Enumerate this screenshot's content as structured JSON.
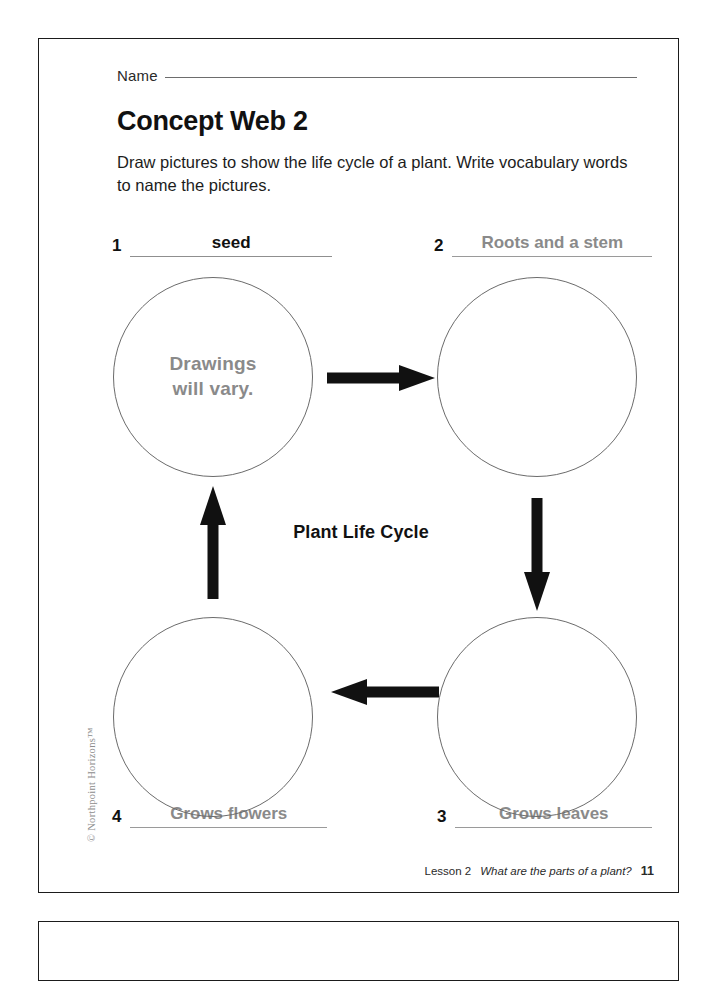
{
  "page": {
    "name_label": "Name",
    "title": "Concept Web 2",
    "instructions": "Draw pictures to show the life cycle of a plant. Write vocabulary words to name the pictures.",
    "center_label": "Plant Life Cycle",
    "circle_note": "Drawings\nwill vary.",
    "circle_note_line1": "Drawings",
    "circle_note_line2": "will vary.",
    "copyright": "© Northpoint Horizons™"
  },
  "slots": [
    {
      "number": "1",
      "answer": "seed",
      "style": "dark"
    },
    {
      "number": "2",
      "answer": "Roots and a stem",
      "style": "gray"
    },
    {
      "number": "3",
      "answer": "Grows leaves",
      "style": "gray"
    },
    {
      "number": "4",
      "answer": "Grows flowers",
      "style": "gray"
    }
  ],
  "footer": {
    "lesson": "Lesson 2",
    "question": "What are the parts of a plant?",
    "page_number": "11"
  },
  "colors": {
    "answer_gray": "#8a8a8a",
    "ink_black": "#111111",
    "circle_stroke": "#6b6b6b",
    "border": "#1b1b1b"
  }
}
